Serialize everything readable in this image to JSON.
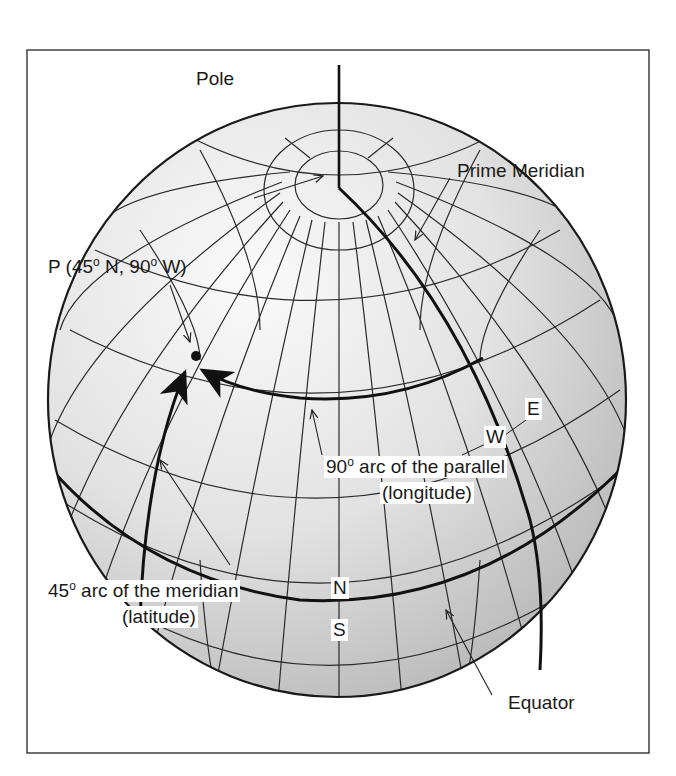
{
  "diagram": {
    "type": "globe-coordinate-illustration",
    "colors": {
      "frame": "#333333",
      "line": "#2a2a2a",
      "bold_line": "#111111",
      "globe_light": "#f4f4f4",
      "globe_dark": "#b8b8b8"
    },
    "labels": {
      "pole": "Pole",
      "prime_meridian": "Prime Meridian",
      "point_p": "P (45",
      "point_p_deg1": "o",
      "point_p_mid": " N, 90",
      "point_p_deg2": "o",
      "point_p_end": " W)",
      "parallel_arc_num": "90",
      "parallel_arc_deg": "o",
      "parallel_arc_text": " arc of the parallel",
      "parallel_arc_sub": "(longitude)",
      "meridian_arc_num": "45",
      "meridian_arc_deg": "o",
      "meridian_arc_text": " arc of the meridian",
      "meridian_arc_sub": "(latitude)",
      "north": "N",
      "south": "S",
      "east": "E",
      "west": "W",
      "equator": "Equator"
    }
  }
}
